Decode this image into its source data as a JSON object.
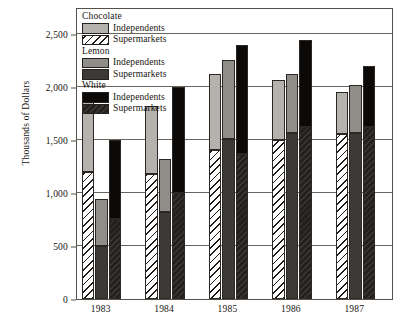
{
  "chart_data": {
    "type": "bar",
    "subtype": "grouped-stacked",
    "title": "",
    "xlabel": "",
    "ylabel": "Thousands of Dollars",
    "ylim": [
      0,
      2750
    ],
    "yticks": [
      0,
      500,
      1000,
      1500,
      2000,
      2500
    ],
    "ytick_labels": [
      "0",
      "500",
      "1,000",
      "1,500",
      "2,000",
      "2,500"
    ],
    "grid": true,
    "legend_position": "top-left-inside",
    "categories": [
      "1983",
      "1984",
      "1985",
      "1986",
      "1987"
    ],
    "groups": [
      {
        "name": "Chocolate",
        "series": [
          {
            "name": "Supermarkets",
            "stack_order": 0,
            "values": [
              1200,
              1180,
              1400,
              1500,
              1550
            ]
          },
          {
            "name": "Independents",
            "stack_order": 1,
            "values": [
              690,
              640,
              720,
              560,
              400
            ]
          }
        ],
        "totals": [
          1890,
          1820,
          2120,
          2060,
          1950
        ]
      },
      {
        "name": "Lemon",
        "series": [
          {
            "name": "Supermarkets",
            "stack_order": 0,
            "values": [
              500,
              820,
              1510,
              1560,
              1560
            ]
          },
          {
            "name": "Independents",
            "stack_order": 1,
            "values": [
              440,
              500,
              740,
              560,
              460
            ]
          }
        ],
        "totals": [
          940,
          1320,
          2250,
          2120,
          2020
        ]
      },
      {
        "name": "White",
        "series": [
          {
            "name": "Supermarkets",
            "stack_order": 0,
            "values": [
              750,
              1000,
              1370,
              1620,
              1620
            ]
          },
          {
            "name": "Independents",
            "stack_order": 1,
            "values": [
              750,
              1000,
              1020,
              820,
              570
            ]
          }
        ],
        "totals": [
          1500,
          2000,
          2390,
          2440,
          2190
        ]
      }
    ]
  },
  "axis": {
    "y_title": "Thousands of Dollars",
    "y_tick_labels": [
      "2,500",
      "2,000",
      "1,500",
      "1,000",
      "500",
      "0"
    ],
    "x_tick_labels": [
      "1983",
      "1984",
      "1985",
      "1986",
      "1987"
    ]
  },
  "legend": {
    "groups": [
      {
        "title": "Chocolate",
        "entries": [
          {
            "label": "Independents",
            "swatch": "solid-light-gray",
            "color": "#b4b2ad"
          },
          {
            "label": "Supermarkets",
            "swatch": "diagonal-hatch-white",
            "color": "#ffffff"
          }
        ]
      },
      {
        "title": "Lemon",
        "entries": [
          {
            "label": "Independents",
            "swatch": "solid-medium-gray",
            "color": "#8f8d88"
          },
          {
            "label": "Supermarkets",
            "swatch": "solid-dark-gray",
            "color": "#3c3a37"
          }
        ]
      },
      {
        "title": "White",
        "entries": [
          {
            "label": "Independents",
            "swatch": "solid-black",
            "color": "#0b0a09"
          },
          {
            "label": "Supermarkets",
            "swatch": "dark-textured",
            "color": "#2a2826"
          }
        ]
      }
    ]
  },
  "colors": {
    "chocolate_independents": "#b4b2ad",
    "chocolate_supermarkets": "#ffffff",
    "lemon_independents": "#8f8d88",
    "lemon_supermarkets": "#3c3a37",
    "white_independents": "#0b0a09",
    "white_supermarkets": "#2a2826",
    "axis": "#55504a",
    "grid": "#6a645d",
    "text": "#17140f",
    "background": "#ffffff"
  }
}
